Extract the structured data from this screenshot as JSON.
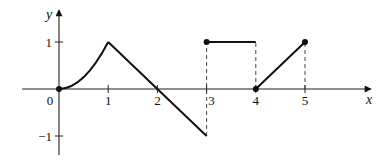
{
  "chart_data": {
    "type": "line",
    "title": "",
    "xlabel": "x",
    "ylabel": "y",
    "xlim": [
      -0.75,
      6.4
    ],
    "ylim": [
      -1.4,
      1.7
    ],
    "grid": false,
    "x_ticks": [
      {
        "value": 0,
        "label": "0"
      },
      {
        "value": 1,
        "label": "1"
      },
      {
        "value": 2,
        "label": "2"
      },
      {
        "value": 3,
        "label": "3"
      },
      {
        "value": 4,
        "label": "4"
      },
      {
        "value": 5,
        "label": "5"
      }
    ],
    "y_ticks": [
      {
        "value": 1,
        "label": "1"
      },
      {
        "value": -1,
        "label": "−1"
      }
    ],
    "series": [
      {
        "name": "curve 0→1",
        "kind": "curve",
        "description": "concave-up curve (x^2)",
        "points": [
          [
            0,
            0
          ],
          [
            0.25,
            0.0625
          ],
          [
            0.5,
            0.25
          ],
          [
            0.75,
            0.5625
          ],
          [
            1,
            1
          ]
        ]
      },
      {
        "name": "segment 1→3",
        "kind": "line",
        "points": [
          [
            1,
            1
          ],
          [
            2,
            0
          ],
          [
            3,
            -1
          ]
        ]
      },
      {
        "name": "segment 3→4",
        "kind": "line",
        "points": [
          [
            3,
            1
          ],
          [
            4,
            1
          ]
        ]
      },
      {
        "name": "segment 4→5",
        "kind": "line",
        "points": [
          [
            4,
            0
          ],
          [
            5,
            1
          ]
        ]
      }
    ],
    "dashed_guides": [
      {
        "x": 3,
        "from": -1,
        "to": 1
      },
      {
        "x": 4,
        "from": 0,
        "to": 1
      },
      {
        "x": 5,
        "from": 0,
        "to": 1
      }
    ],
    "dots": [
      [
        0,
        0
      ],
      [
        3,
        1
      ],
      [
        4,
        0
      ],
      [
        5,
        1
      ]
    ]
  },
  "pixel_map": {
    "origin_x": 59,
    "origin_y": 89,
    "unit_x": 49.2,
    "unit_y": 47
  }
}
